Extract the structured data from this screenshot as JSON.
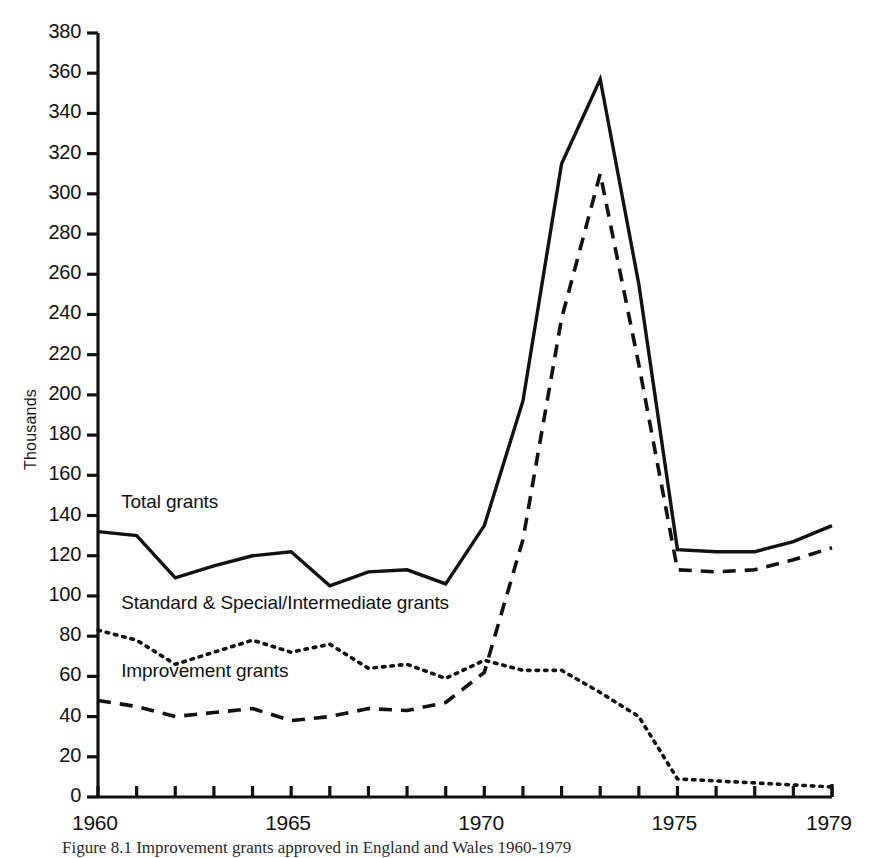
{
  "figure": {
    "caption": "Figure 8.1 Improvement grants approved in England and Wales 1960-1979",
    "axis_y_title": "Thousands"
  },
  "chart_data": {
    "type": "line",
    "title": "",
    "subtitle": "",
    "xlabel": "",
    "ylabel": "Thousands",
    "xlim": [
      1960,
      1979
    ],
    "ylim": [
      0,
      380
    ],
    "ytick_step": 20,
    "grid": false,
    "legend_position": "inline-annotations",
    "x": [
      1960,
      1961,
      1962,
      1963,
      1964,
      1965,
      1966,
      1967,
      1968,
      1969,
      1970,
      1971,
      1972,
      1973,
      1974,
      1975,
      1976,
      1977,
      1978,
      1979
    ],
    "xtick_labels": [
      "1960",
      "1965",
      "1970",
      "1975",
      "1979"
    ],
    "xtick_values": [
      1960,
      1965,
      1970,
      1975,
      1979
    ],
    "ytick_labels": [
      "0",
      "20",
      "40",
      "60",
      "80",
      "100",
      "120",
      "140",
      "160",
      "180",
      "200",
      "220",
      "240",
      "260",
      "280",
      "300",
      "320",
      "340",
      "360",
      "380"
    ],
    "ytick_values": [
      0,
      20,
      40,
      60,
      80,
      100,
      120,
      140,
      160,
      180,
      200,
      220,
      240,
      260,
      280,
      300,
      320,
      340,
      360,
      380
    ],
    "series": [
      {
        "name": "Total grants",
        "style": "solid",
        "color": "#111111",
        "label_x": 1960.6,
        "label_y": 146,
        "values": [
          132,
          130,
          109,
          115,
          120,
          122,
          105,
          112,
          113,
          106,
          135,
          197,
          315,
          357,
          255,
          123,
          122,
          122,
          127,
          135
        ]
      },
      {
        "name": "Standard & Special/Intermediate grants",
        "style": "dotted",
        "color": "#111111",
        "label_x": 1960.6,
        "label_y": 96,
        "values": [
          83,
          78,
          66,
          72,
          78,
          72,
          76,
          64,
          66,
          59,
          68,
          63,
          63,
          52,
          40,
          9,
          8,
          7,
          6,
          5
        ]
      },
      {
        "name": "Improvement grants",
        "style": "dashed",
        "color": "#111111",
        "label_x": 1960.6,
        "label_y": 62,
        "values": [
          48,
          45,
          40,
          42,
          44,
          38,
          40,
          44,
          43,
          47,
          62,
          128,
          238,
          310,
          215,
          113,
          112,
          113,
          118,
          124
        ]
      }
    ]
  },
  "geometry": {
    "plot_left": 98,
    "plot_right": 832,
    "plot_top": 33,
    "plot_bottom": 797
  }
}
